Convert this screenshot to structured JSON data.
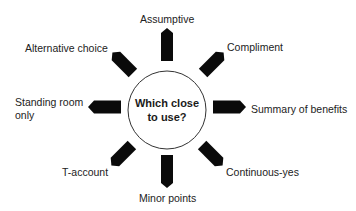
{
  "diagram": {
    "center": {
      "line1": "Which close",
      "line2": "to use?"
    },
    "options": [
      {
        "id": "top",
        "label": "Assumptive"
      },
      {
        "id": "top-right",
        "label": "Compliment"
      },
      {
        "id": "right",
        "label": "Summary of benefits"
      },
      {
        "id": "bottom-right",
        "label": "Continuous-yes"
      },
      {
        "id": "bottom",
        "label": "Minor points"
      },
      {
        "id": "bottom-left",
        "label": "T-account"
      },
      {
        "id": "left",
        "label_line1": "Standing room",
        "label_line2": "only"
      },
      {
        "id": "top-left",
        "label": "Alternative choice"
      }
    ],
    "colors": {
      "arrow": "#0a0a0a",
      "circle_stroke": "#333333",
      "background": "#ffffff"
    }
  }
}
